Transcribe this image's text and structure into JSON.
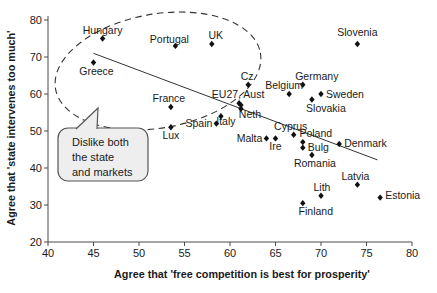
{
  "figure": {
    "background": "#ffffff",
    "width_px": 437,
    "height_px": 293
  },
  "chart_data": {
    "type": "scatter",
    "title": "",
    "xlabel": "Agree that 'free competition is best for prosperity'",
    "ylabel": "Agree that 'state intervenes too much'",
    "xlim": [
      40,
      80
    ],
    "ylim": [
      20,
      80
    ],
    "xticks": [
      40,
      45,
      50,
      55,
      60,
      65,
      70,
      75,
      80
    ],
    "yticks": [
      20,
      30,
      40,
      50,
      60,
      70,
      80
    ],
    "grid": false,
    "legend": false,
    "marker": "diamond",
    "marker_color": "#111111",
    "points": [
      {
        "name": "Hungary",
        "x": 46,
        "y": 75,
        "pos": "above",
        "dx": 0
      },
      {
        "name": "Portugal",
        "x": 54,
        "y": 73,
        "pos": "above",
        "dx": -6,
        "dy": 2
      },
      {
        "name": "UK",
        "x": 58,
        "y": 73.5,
        "pos": "above",
        "dx": 4
      },
      {
        "name": "Slovenia",
        "x": 74,
        "y": 73.5,
        "pos": "above",
        "dx": 0,
        "dy": -3
      },
      {
        "name": "Greece",
        "x": 45,
        "y": 68.5,
        "pos": "below",
        "dx": 3
      },
      {
        "name": "Cz",
        "x": 62,
        "y": 62.5,
        "pos": "above",
        "dx": -1
      },
      {
        "name": "Germany",
        "x": 68,
        "y": 62.5,
        "pos": "above",
        "dx": 14
      },
      {
        "name": "Belgium",
        "x": 66.5,
        "y": 60,
        "pos": "above",
        "dx": -5
      },
      {
        "name": "Sweden",
        "x": 70,
        "y": 60,
        "pos": "right"
      },
      {
        "name": "Slovakia",
        "x": 69,
        "y": 58.5,
        "pos": "below",
        "dx": 14
      },
      {
        "name": "EU27",
        "x": 61,
        "y": 57.5,
        "pos": "above",
        "dx": -1,
        "label": "EU27, Aust"
      },
      {
        "name": "Aust",
        "x": 61.2,
        "y": 57,
        "no_label": true
      },
      {
        "name": "Neth",
        "x": 61.2,
        "y": 56,
        "pos": "below",
        "dx": 9,
        "dy": -3
      },
      {
        "name": "France",
        "x": 53.5,
        "y": 56.5,
        "pos": "above",
        "dx": -2
      },
      {
        "name": "Italy",
        "x": 59,
        "y": 54,
        "pos": "below",
        "dx": 5,
        "dy": -3
      },
      {
        "name": "Spain",
        "x": 58.5,
        "y": 52,
        "pos": "left"
      },
      {
        "name": "Lux",
        "x": 53.5,
        "y": 51,
        "pos": "below",
        "dx": 0
      },
      {
        "name": "Cyprus",
        "x": 67,
        "y": 49,
        "pos": "above",
        "dx": -3
      },
      {
        "name": "Malta",
        "x": 64,
        "y": 48,
        "pos": "left"
      },
      {
        "name": "Ire",
        "x": 65,
        "y": 48,
        "pos": "below",
        "dx": 0
      },
      {
        "name": "Poland",
        "x": 68,
        "y": 47,
        "pos": "above",
        "dx": 13
      },
      {
        "name": "Bulg",
        "x": 68,
        "y": 45.5,
        "pos": "right"
      },
      {
        "name": "Denmark",
        "x": 72,
        "y": 46.5,
        "pos": "right"
      },
      {
        "name": "Romania",
        "x": 69,
        "y": 43.5,
        "pos": "below",
        "dx": 3
      },
      {
        "name": "Latvia",
        "x": 74,
        "y": 35.5,
        "pos": "above",
        "dx": -2
      },
      {
        "name": "Lith",
        "x": 70,
        "y": 32.5,
        "pos": "above",
        "dx": 1
      },
      {
        "name": "Estonia",
        "x": 76.5,
        "y": 32,
        "pos": "right",
        "dy": -2
      },
      {
        "name": "Finland",
        "x": 68,
        "y": 30.5,
        "pos": "below",
        "dx": 13
      }
    ],
    "trend_line": {
      "x1": 45,
      "y1": 71,
      "x2": 76.2,
      "y2": 42.2
    },
    "annotations": {
      "ellipse": {
        "style": "dashed",
        "encircles": [
          "Hungary",
          "Portugal",
          "UK",
          "Greece",
          "France"
        ],
        "cx_px": 158,
        "cy_px": 71,
        "rx_px": 104,
        "ry_px": 57,
        "rotation_deg": -10
      },
      "callout": {
        "lines": [
          "Dislike both",
          "the state",
          "and markets"
        ],
        "box_px": {
          "x": 58,
          "y": 128,
          "w": 90,
          "h": 53
        },
        "pointer_tip_px": {
          "x": 98,
          "y": 108
        }
      }
    }
  }
}
